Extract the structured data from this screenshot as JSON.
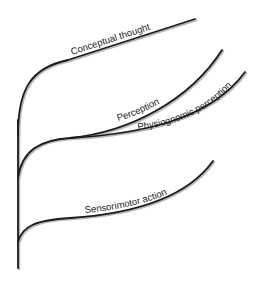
{
  "diagram": {
    "type": "branching-tree",
    "branches": [
      {
        "id": "conceptual",
        "label": "Conceptual thought"
      },
      {
        "id": "perception",
        "label": "Perception"
      },
      {
        "id": "physiognomic",
        "label": "Physiognomic perception"
      },
      {
        "id": "sensorimotor",
        "label": "Sensorimotor action"
      }
    ],
    "colors": {
      "line": "#1a1a1a",
      "shadow": "#b8b8b8",
      "text": "#222222",
      "background": "#ffffff"
    }
  }
}
